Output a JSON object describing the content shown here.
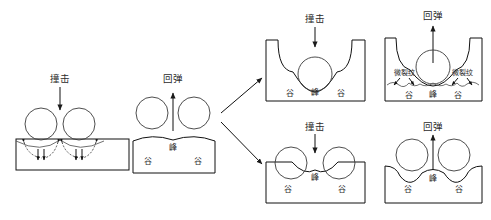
{
  "figure": {
    "type": "process-schematic",
    "background_color": "#ffffff",
    "line_color": "#3a3a3a",
    "text_color": "#2b2b2b"
  },
  "terms": {
    "impact": "撞击",
    "rebound": "回弹",
    "peak": "峰",
    "valley": "谷",
    "microcrack": "微裂纹"
  },
  "panels": [
    {
      "id": "panel-1",
      "name": "initial-impact-flat-surface",
      "stage_label": "撞击",
      "surface": "flat",
      "balls": 2,
      "surface_labels": [],
      "annotations": [
        "撞击"
      ],
      "has_stress_arrows": true,
      "arrow_direction": "down"
    },
    {
      "id": "panel-2",
      "name": "first-rebound-wavy-surface",
      "stage_label": "回弹",
      "surface": "wavy",
      "balls": 2,
      "surface_labels": [
        "谷",
        "峰",
        "谷"
      ],
      "annotations": [
        "回弹"
      ],
      "has_stress_arrows": false,
      "arrow_direction": "up"
    },
    {
      "id": "panel-3",
      "name": "second-impact-on-peak",
      "stage_label": "撞击",
      "surface": "deep-wavy",
      "balls": 1,
      "surface_labels": [
        "谷",
        "峰",
        "谷"
      ],
      "annotations": [
        "撞击"
      ],
      "has_stress_arrows": false,
      "arrow_direction": "down"
    },
    {
      "id": "panel-4",
      "name": "rebound-with-microcracks",
      "stage_label": "回弹",
      "surface": "cracked-wavy",
      "balls": 1,
      "surface_labels": [
        "谷",
        "峰",
        "谷"
      ],
      "annotations": [
        "回弹",
        "微裂纹",
        "微裂纹"
      ],
      "has_stress_arrows": false,
      "arrow_direction": "up"
    },
    {
      "id": "panel-5",
      "name": "second-impact-in-valleys",
      "stage_label": "撞击",
      "surface": "shallow-wavy",
      "balls": 2,
      "surface_labels": [
        "谷",
        "峰",
        "谷"
      ],
      "annotations": [
        "撞击"
      ],
      "has_stress_arrows": false,
      "arrow_direction": "down"
    },
    {
      "id": "panel-6",
      "name": "rebound-deep-valleys",
      "stage_label": "回弹",
      "surface": "deep-valley",
      "balls": 2,
      "surface_labels": [
        "谷",
        "峰",
        "谷"
      ],
      "annotations": [
        "回弹"
      ],
      "has_stress_arrows": false,
      "arrow_direction": "up"
    }
  ],
  "flow_arrows": [
    {
      "name": "branch-arrow-upper",
      "from": "panel-2",
      "to": "panel-3",
      "direction": "up-right"
    },
    {
      "name": "branch-arrow-lower",
      "from": "panel-2",
      "to": "panel-5",
      "direction": "down-right"
    }
  ]
}
